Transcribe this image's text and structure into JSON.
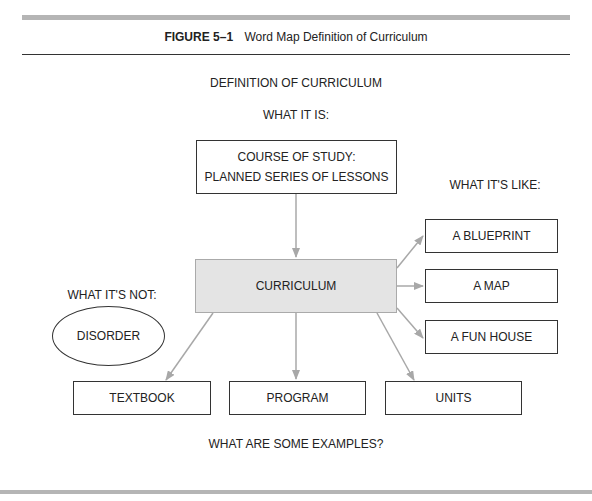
{
  "figure": {
    "number": "FIGURE 5–1",
    "title": "Word Map Definition of Curriculum"
  },
  "diagram": {
    "heading": "DEFINITION OF CURRICULUM",
    "what_it_is": {
      "label": "WHAT IT IS:",
      "line1": "COURSE OF STUDY:",
      "line2": "PLANNED SERIES OF LESSONS"
    },
    "central": "CURRICULUM",
    "what_its_like": {
      "label": "WHAT IT'S LIKE:",
      "items": [
        "A BLUEPRINT",
        "A MAP",
        "A FUN HOUSE"
      ]
    },
    "what_its_not": {
      "label": "WHAT IT'S NOT:",
      "items": [
        "DISORDER"
      ]
    },
    "examples": {
      "label": "WHAT ARE SOME EXAMPLES?",
      "items": [
        "TEXTBOOK",
        "PROGRAM",
        "UNITS"
      ]
    },
    "colors": {
      "arrow": "#a8a8a8",
      "central_fill": "#e4e4e4",
      "box_border": "#333333",
      "rule_bar": "#b5b5b5"
    }
  }
}
